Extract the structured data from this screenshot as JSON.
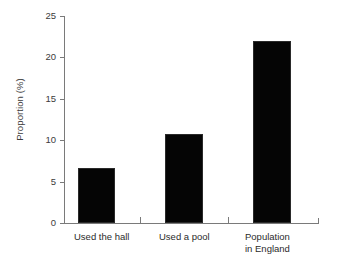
{
  "chart_data": {
    "type": "bar",
    "title": "",
    "subtitle": "",
    "xlabel": "",
    "ylabel": "Proportion (%)",
    "categories": [
      "Used the hall",
      "Used a pool",
      "Population\nin England"
    ],
    "values": [
      6.7,
      10.8,
      22.0
    ],
    "series": [
      {
        "name": "Proportion",
        "values": [
          6.7,
          10.8,
          22.0
        ]
      }
    ],
    "ylim": [
      0,
      25
    ],
    "yticks": [
      0,
      5,
      10,
      15,
      20,
      25
    ],
    "ytick_labels": [
      "0",
      "5",
      "10",
      "15",
      "20",
      "25"
    ],
    "grid": false,
    "legend": "none",
    "bar_color": "#050505",
    "axis_color": "#7a7a7a",
    "text_color": "#2b2b2b",
    "background_color": "#ffffff"
  },
  "axis": {
    "y_label": "Proportion (%)",
    "ticks": [
      "25",
      "20",
      "15",
      "10",
      "5",
      "0"
    ]
  },
  "categories": {
    "first": "Used the hall",
    "second": "Used a pool",
    "third_line1": "Population",
    "third_line2": "in England"
  }
}
